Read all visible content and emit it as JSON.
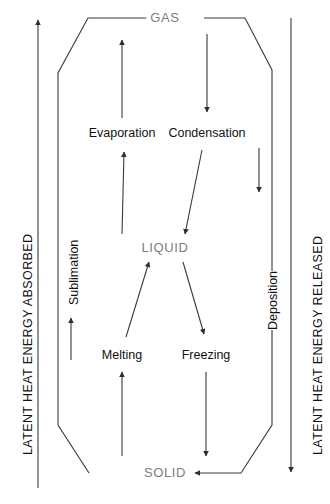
{
  "diagram": {
    "states": [
      {
        "id": "gas",
        "label": "GAS"
      },
      {
        "id": "liquid",
        "label": "LIQUID"
      },
      {
        "id": "solid",
        "label": "SOLID"
      }
    ],
    "processes": [
      {
        "id": "evaporation",
        "label": "Evaporation",
        "from": "LIQUID",
        "to": "GAS"
      },
      {
        "id": "condensation",
        "label": "Condensation",
        "from": "GAS",
        "to": "LIQUID"
      },
      {
        "id": "melting",
        "label": "Melting",
        "from": "SOLID",
        "to": "LIQUID"
      },
      {
        "id": "freezing",
        "label": "Freezing",
        "from": "LIQUID",
        "to": "SOLID"
      },
      {
        "id": "sublimation",
        "label": "Sublimation",
        "from": "SOLID",
        "to": "GAS"
      },
      {
        "id": "deposition",
        "label": "Deposition",
        "from": "GAS",
        "to": "SOLID"
      }
    ],
    "energy_axes": [
      {
        "id": "absorbed",
        "label": "LATENT HEAT ENERGY ABSORBED",
        "direction": "up",
        "side": "left"
      },
      {
        "id": "released",
        "label": "LATENT HEAT ENERGY RELEASED",
        "direction": "down",
        "side": "right"
      }
    ],
    "colors": {
      "state_text": "#7d7d7d",
      "process_text": "#111111",
      "stroke": "#3a3a3a",
      "background": "#ffffff"
    },
    "caption": ""
  }
}
